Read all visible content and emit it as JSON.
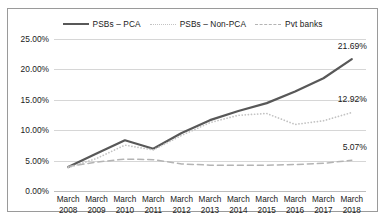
{
  "legend": {
    "items": [
      {
        "label": "PSBs – PCA",
        "style": "solid",
        "color": "#585858"
      },
      {
        "label": "PSBs – Non-PCA",
        "style": "dotted",
        "color": "#c3c3c3"
      },
      {
        "label": "Pvt banks",
        "style": "dashed",
        "color": "#b4b4b4"
      }
    ]
  },
  "yticks": [
    "0.00%",
    "5.00%",
    "10.00%",
    "15.00%",
    "20.00%",
    "25.00%"
  ],
  "end_labels": [
    {
      "text": "21.69%",
      "value": 21.69
    },
    {
      "text": "12.92%",
      "value": 12.92
    },
    {
      "text": "5.07%",
      "value": 5.07
    }
  ],
  "chart_data": {
    "type": "line",
    "title": "",
    "xlabel": "",
    "ylabel": "",
    "ylim": [
      0,
      25
    ],
    "ytick_step": 5,
    "grid": true,
    "legend_position": "top-center",
    "categories": [
      "March 2008",
      "March 2009",
      "March 2010",
      "March 2011",
      "March 2012",
      "March 2013",
      "March 2014",
      "March 2015",
      "March 2016",
      "March 2017",
      "March 2018"
    ],
    "categories_lines": [
      [
        "March",
        "2008"
      ],
      [
        "March",
        "2009"
      ],
      [
        "March",
        "2010"
      ],
      [
        "March",
        "2011"
      ],
      [
        "March",
        "2012"
      ],
      [
        "March",
        "2013"
      ],
      [
        "March",
        "2014"
      ],
      [
        "March",
        "2015"
      ],
      [
        "March",
        "2016"
      ],
      [
        "March",
        "2017"
      ],
      [
        "March",
        "2018"
      ]
    ],
    "series": [
      {
        "name": "PSBs – PCA",
        "style": "solid",
        "color": "#585858",
        "values": [
          3.95,
          6.15,
          8.35,
          6.95,
          9.55,
          11.65,
          13.15,
          14.45,
          16.35,
          18.55,
          21.69
        ]
      },
      {
        "name": "PSBs – Non-PCA",
        "style": "dotted",
        "color": "#c3c3c3",
        "values": [
          3.85,
          5.35,
          7.55,
          6.75,
          9.15,
          11.25,
          12.45,
          12.75,
          10.95,
          11.55,
          12.92
        ]
      },
      {
        "name": "Pvt banks",
        "style": "dashed",
        "color": "#b4b4b4",
        "values": [
          4.05,
          4.75,
          5.25,
          5.15,
          4.45,
          4.25,
          4.25,
          4.25,
          4.35,
          4.55,
          5.07
        ]
      }
    ]
  }
}
